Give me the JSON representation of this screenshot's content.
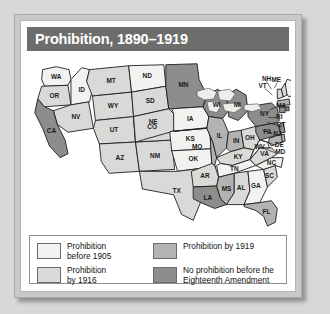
{
  "figure": {
    "title": "Prohibition, 1890–1919",
    "title_bar_color": "#6d6d6b",
    "frame_color": "#c9c9c7",
    "panel_color": "#ffffff"
  },
  "legend": {
    "items": [
      {
        "label": "Prohibition\nbefore 1905",
        "color": "#f2f2f0",
        "key": "before-1905"
      },
      {
        "label": "Prohibition by 1919",
        "color": "#b3b3b1",
        "key": "by-1919"
      },
      {
        "label": "Prohibition\nby 1916",
        "color": "#d9d9d7",
        "key": "by-1916"
      },
      {
        "label": "No prohibition before the\nEighteenth Amendment",
        "color": "#8d8d8b",
        "key": "no-prohibition"
      }
    ]
  },
  "map": {
    "region": "United States",
    "lake_color": "#ededeb",
    "border_color": "#1a1a1a",
    "states": [
      {
        "abbr": "WA",
        "category": "before-1905"
      },
      {
        "abbr": "OR",
        "category": "by-1916"
      },
      {
        "abbr": "ID",
        "category": "before-1905"
      },
      {
        "abbr": "MT",
        "category": "by-1916"
      },
      {
        "abbr": "WY",
        "category": "by-1916"
      },
      {
        "abbr": "NV",
        "category": "by-1916"
      },
      {
        "abbr": "UT",
        "category": "by-1916"
      },
      {
        "abbr": "CA",
        "category": "no-prohibition"
      },
      {
        "abbr": "AZ",
        "category": "by-1916"
      },
      {
        "abbr": "NM",
        "category": "by-1916"
      },
      {
        "abbr": "CO",
        "category": "by-1916"
      },
      {
        "abbr": "ND",
        "category": "before-1905"
      },
      {
        "abbr": "SD",
        "category": "by-1916"
      },
      {
        "abbr": "NE",
        "category": "by-1916"
      },
      {
        "abbr": "KS",
        "category": "before-1905"
      },
      {
        "abbr": "OK",
        "category": "before-1905"
      },
      {
        "abbr": "TX",
        "category": "by-1916"
      },
      {
        "abbr": "MN",
        "category": "no-prohibition"
      },
      {
        "abbr": "IA",
        "category": "before-1905"
      },
      {
        "abbr": "MO",
        "category": "by-1919"
      },
      {
        "abbr": "AR",
        "category": "by-1916"
      },
      {
        "abbr": "LA",
        "category": "no-prohibition"
      },
      {
        "abbr": "WI",
        "category": "no-prohibition"
      },
      {
        "abbr": "IL",
        "category": "by-1919"
      },
      {
        "abbr": "MI",
        "category": "no-prohibition"
      },
      {
        "abbr": "IN",
        "category": "by-1919"
      },
      {
        "abbr": "OH",
        "category": "by-1916"
      },
      {
        "abbr": "KY",
        "category": "by-1916"
      },
      {
        "abbr": "TN",
        "category": "before-1905"
      },
      {
        "abbr": "MS",
        "category": "by-1919"
      },
      {
        "abbr": "AL",
        "category": "by-1916"
      },
      {
        "abbr": "GA",
        "category": "before-1905"
      },
      {
        "abbr": "FL",
        "category": "by-1919"
      },
      {
        "abbr": "SC",
        "category": "by-1916"
      },
      {
        "abbr": "NC",
        "category": "before-1905"
      },
      {
        "abbr": "VA",
        "category": "by-1916"
      },
      {
        "abbr": "WV",
        "category": "before-1905"
      },
      {
        "abbr": "PA",
        "category": "no-prohibition"
      },
      {
        "abbr": "NY",
        "category": "no-prohibition"
      },
      {
        "abbr": "ME",
        "category": "before-1905"
      },
      {
        "abbr": "NH",
        "category": "by-1916"
      },
      {
        "abbr": "VT",
        "category": "by-1916"
      },
      {
        "abbr": "MA",
        "category": "by-1919"
      },
      {
        "abbr": "RI",
        "category": "no-prohibition"
      },
      {
        "abbr": "CT",
        "category": "no-prohibition"
      },
      {
        "abbr": "NJ",
        "category": "no-prohibition"
      },
      {
        "abbr": "DE",
        "category": "by-1919"
      },
      {
        "abbr": "MD",
        "category": "by-1919"
      }
    ],
    "callout_labels": [
      "NH",
      "VT",
      "ME",
      "MA",
      "RI",
      "CT",
      "NJ",
      "DE",
      "MD"
    ]
  }
}
